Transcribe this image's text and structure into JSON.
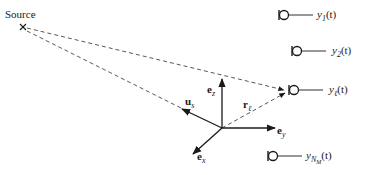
{
  "diagram": {
    "source": {
      "label": "Source",
      "marker": "×"
    },
    "coordinate_system": {
      "e_z": {
        "base": "e",
        "sub": "z"
      },
      "e_y": {
        "base": "e",
        "sub": "y"
      },
      "e_x": {
        "base": "e",
        "sub": "x"
      },
      "u_s": {
        "base": "u",
        "sub": "s"
      },
      "r_l": {
        "base": "r",
        "sub": "ℓ"
      }
    },
    "microphones": [
      {
        "base": "y",
        "sub": "1",
        "subsub": "",
        "arg": "(t)"
      },
      {
        "base": "y",
        "sub": "2",
        "subsub": "",
        "arg": "(t)"
      },
      {
        "base": "y",
        "sub": "ℓ",
        "subsub": "",
        "arg": "(t)"
      },
      {
        "base": "y",
        "sub": "N",
        "subsub": "M",
        "arg": "(t)"
      }
    ],
    "colors": {
      "stroke": "#1a1a1a",
      "dashed": "#444444",
      "background": "#ffffff"
    }
  }
}
